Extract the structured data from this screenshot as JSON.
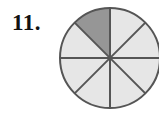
{
  "figure": {
    "problem_number": "11.",
    "alt_label": "circle divided into eighths with one eighth shaded"
  },
  "colors": {
    "background": "#ffffff",
    "shaded_sector": "#969696",
    "unshaded_sector": "#e6e6e6",
    "outline": "#555555",
    "divider": "#555555",
    "number_text": "#111111"
  },
  "chart_data": {
    "type": "pie",
    "title": "",
    "subtitle": "",
    "xlabel": "",
    "ylabel": "",
    "total_sectors": 8,
    "shaded_sectors": 1,
    "fraction_shaded": "1/8",
    "fraction_value": 0.125,
    "categories": [
      "sector-1",
      "sector-2",
      "sector-3",
      "sector-4",
      "sector-5",
      "sector-6",
      "sector-7",
      "sector-8"
    ],
    "values": [
      12.5,
      12.5,
      12.5,
      12.5,
      12.5,
      12.5,
      12.5,
      12.5
    ],
    "sectors": [
      {
        "id": "sector-1",
        "start_deg": 90,
        "end_deg": 135,
        "shaded": true,
        "fill": "#969696"
      },
      {
        "id": "sector-2",
        "start_deg": 135,
        "end_deg": 180,
        "shaded": false,
        "fill": "#e6e6e6"
      },
      {
        "id": "sector-3",
        "start_deg": 180,
        "end_deg": 225,
        "shaded": false,
        "fill": "#e6e6e6"
      },
      {
        "id": "sector-4",
        "start_deg": 225,
        "end_deg": 270,
        "shaded": false,
        "fill": "#e6e6e6"
      },
      {
        "id": "sector-5",
        "start_deg": 270,
        "end_deg": 315,
        "shaded": false,
        "fill": "#e6e6e6"
      },
      {
        "id": "sector-6",
        "start_deg": 315,
        "end_deg": 360,
        "shaded": false,
        "fill": "#e6e6e6"
      },
      {
        "id": "sector-7",
        "start_deg": 0,
        "end_deg": 45,
        "shaded": false,
        "fill": "#e6e6e6"
      },
      {
        "id": "sector-8",
        "start_deg": 45,
        "end_deg": 90,
        "shaded": false,
        "fill": "#e6e6e6"
      }
    ],
    "geometry": {
      "center_x": 52,
      "center_y": 52,
      "radius": 50,
      "stroke_width": 2
    },
    "legend_position": "none",
    "grid": false
  }
}
